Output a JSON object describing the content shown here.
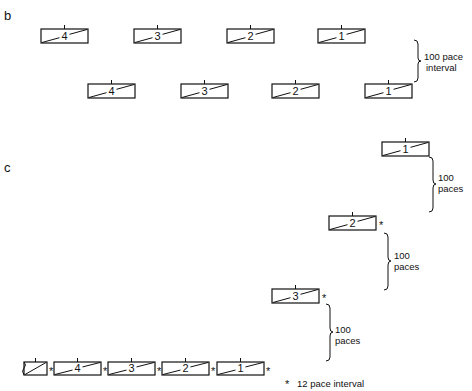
{
  "panel_b": {
    "label": "b",
    "row1": [
      {
        "number": "4",
        "x": 41,
        "y": 29
      },
      {
        "number": "3",
        "x": 134,
        "y": 29
      },
      {
        "number": "2",
        "x": 227,
        "y": 29
      },
      {
        "number": "1",
        "x": 318,
        "y": 29
      }
    ],
    "row2": [
      {
        "number": "4",
        "x": 88,
        "y": 84
      },
      {
        "number": "3",
        "x": 181,
        "y": 84
      },
      {
        "number": "2",
        "x": 272,
        "y": 84
      },
      {
        "number": "1",
        "x": 365,
        "y": 84
      }
    ],
    "interval_label_line1": "100 pace",
    "interval_label_line2": "interval"
  },
  "panel_c": {
    "label": "c",
    "echelon": [
      {
        "number": "1",
        "x": 382,
        "y": 142,
        "asterisk": false
      },
      {
        "number": "2",
        "x": 329,
        "y": 216,
        "asterisk": true
      },
      {
        "number": "3",
        "x": 272,
        "y": 289,
        "asterisk": true
      }
    ],
    "brace_labels": [
      {
        "line1": "100",
        "line2": "paces"
      },
      {
        "line1": "100",
        "line2": "paces"
      },
      {
        "line1": "100",
        "line2": "paces"
      }
    ],
    "bottom_row": [
      {
        "number": "",
        "x": 24,
        "w": 23,
        "partial": true
      },
      {
        "number": "4",
        "x": 54,
        "w": 47
      },
      {
        "number": "3",
        "x": 108,
        "w": 47
      },
      {
        "number": "2",
        "x": 162,
        "w": 47
      },
      {
        "number": "1",
        "x": 217,
        "w": 47
      }
    ],
    "legend": {
      "symbol": "*",
      "text": "12 pace interval"
    }
  },
  "colors": {
    "ink": "#111111",
    "background": "#ffffff"
  }
}
